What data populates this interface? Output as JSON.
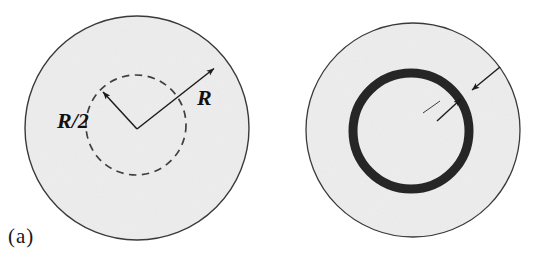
{
  "figure": {
    "width": 542,
    "height": 265,
    "background_color": "#ffffff",
    "disc_fill_color": "#ededed",
    "outline_color": "#3a3a3a",
    "ring_color": "#262626",
    "label_color": "#111111"
  },
  "panels": [
    {
      "id": "a",
      "caption": "(a)",
      "outer_circle": {
        "name": "outer-disc",
        "cx": 137,
        "cy": 128,
        "r": 112,
        "stroke": "#3a3a3a",
        "fill": "#ededed",
        "style": "solid"
      },
      "inner_circle": {
        "name": "inner-dashed-circle",
        "cx": 136,
        "cy": 125,
        "r": 50,
        "stroke": "#3a3a3a",
        "fill": "none",
        "style": "dashed"
      },
      "radius_arrows": [
        {
          "name": "radius-arrow-outer",
          "label": "R",
          "from_x": 137,
          "from_y": 129,
          "to_x": 216,
          "to_y": 67
        },
        {
          "name": "radius-arrow-inner",
          "label": "R/2",
          "from_x": 137,
          "from_y": 129,
          "to_x": 101,
          "to_y": 90
        }
      ],
      "labels": [
        {
          "name": "label-R",
          "text": "R"
        },
        {
          "name": "label-R-half",
          "text": "R/2"
        }
      ]
    },
    {
      "id": "b",
      "caption": "(b)",
      "outer_circle": {
        "name": "outer-disc",
        "cx": 413,
        "cy": 130,
        "r": 107,
        "stroke": "#3a3a3a",
        "fill": "#ededed",
        "style": "solid"
      },
      "annulus": {
        "name": "annular-element",
        "cx": 411,
        "cy": 131,
        "r": 58,
        "thickness": 9,
        "fill": "#262626"
      },
      "thickness_arrows": [
        {
          "name": "dr-arrow-inner",
          "from_x": 436,
          "from_y": 121,
          "to_x": 464,
          "to_y": 97
        },
        {
          "name": "dr-arrow-outer",
          "from_x": 497,
          "from_y": 70,
          "to_x": 470,
          "to_y": 92
        }
      ],
      "leader_line": {
        "name": "dr-leader-line",
        "from_x": 424,
        "from_y": 112,
        "to_x": 441,
        "to_y": 100
      },
      "labels": [
        {
          "name": "label-dr",
          "text_d": "d",
          "text_r": "r",
          "text": "dr"
        }
      ]
    }
  ]
}
